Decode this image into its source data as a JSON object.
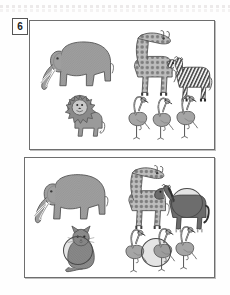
{
  "worksheet": {
    "exercise_number": "6",
    "type": "spot-the-difference",
    "top_rule_visible": true
  },
  "panels": [
    {
      "id": "panel-top",
      "name": "reference-scene",
      "animals": [
        {
          "name": "elephant",
          "icon": "elephant-icon",
          "x": 8,
          "y": 16,
          "w": 78,
          "h": 60,
          "color": "#9e9e9e"
        },
        {
          "name": "giraffe",
          "icon": "giraffe-icon",
          "x": 88,
          "y": 8,
          "w": 62,
          "h": 72,
          "color": "#a8a8a8"
        },
        {
          "name": "zebra",
          "icon": "zebra-icon",
          "x": 135,
          "y": 33,
          "w": 48,
          "h": 52,
          "color": "#8f8f8f"
        },
        {
          "name": "lion",
          "icon": "lion-icon",
          "x": 32,
          "y": 72,
          "w": 45,
          "h": 48,
          "color": "#9a9a9a"
        },
        {
          "name": "flamingo-1",
          "icon": "flamingo-icon",
          "x": 96,
          "y": 72,
          "w": 26,
          "h": 48,
          "color": "#a5a5a5"
        },
        {
          "name": "flamingo-2",
          "icon": "flamingo-icon",
          "x": 120,
          "y": 74,
          "w": 26,
          "h": 46,
          "color": "#a5a5a5"
        },
        {
          "name": "flamingo-3",
          "icon": "flamingo-icon",
          "x": 144,
          "y": 70,
          "w": 26,
          "h": 50,
          "color": "#a5a5a5"
        }
      ],
      "differences": []
    },
    {
      "id": "panel-bottom",
      "name": "altered-scene",
      "animals": [
        {
          "name": "elephant",
          "icon": "elephant-icon",
          "x": 6,
          "y": 12,
          "w": 80,
          "h": 60,
          "color": "#9e9e9e"
        },
        {
          "name": "giraffe",
          "icon": "giraffe-icon",
          "x": 88,
          "y": 6,
          "w": 60,
          "h": 70,
          "color": "#a8a8a8"
        },
        {
          "name": "horse",
          "icon": "horse-icon",
          "x": 128,
          "y": 26,
          "w": 58,
          "h": 52,
          "color": "#6b6b6b"
        },
        {
          "name": "cat",
          "icon": "cat-icon",
          "x": 36,
          "y": 68,
          "w": 40,
          "h": 48,
          "color": "#8d8d8d"
        },
        {
          "name": "flamingo-1",
          "icon": "flamingo-icon",
          "x": 98,
          "y": 68,
          "w": 26,
          "h": 48,
          "color": "#a5a5a5"
        },
        {
          "name": "flamingo-2",
          "icon": "flamingo-icon",
          "x": 126,
          "y": 66,
          "w": 26,
          "h": 50,
          "color": "#a5a5a5"
        },
        {
          "name": "flamingo-3",
          "icon": "flamingo-icon",
          "x": 148,
          "y": 64,
          "w": 26,
          "h": 50,
          "color": "#a5a5a5"
        }
      ],
      "differences": [
        {
          "name": "difference-horse",
          "label": "zebra replaced by horse",
          "x": 146,
          "y": 30,
          "w": 30,
          "h": 28
        },
        {
          "name": "difference-cat",
          "label": "lion replaced by cat",
          "x": 38,
          "y": 78,
          "w": 28,
          "h": 27
        },
        {
          "name": "difference-flamingo",
          "label": "flamingo marked",
          "x": 116,
          "y": 80,
          "w": 28,
          "h": 27
        }
      ]
    }
  ],
  "colors": {
    "frame": "#6e6e6e",
    "page": "#fefefe",
    "ring": "#4a4a4a",
    "badge_text": "#222222"
  }
}
